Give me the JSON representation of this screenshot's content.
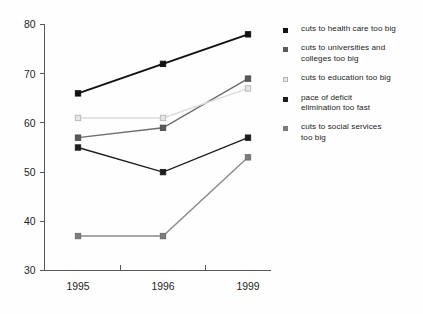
{
  "chart_data": {
    "type": "line",
    "title": "",
    "subtitle": "",
    "xlabel": "",
    "ylabel": "",
    "categories": [
      "1995",
      "1996",
      "1999"
    ],
    "x": [
      1995,
      1996,
      1999
    ],
    "ylim": [
      30,
      80
    ],
    "yticks": [
      30,
      40,
      50,
      60,
      70,
      80
    ],
    "ytick_labels": [
      "30",
      "40",
      "50",
      "60",
      "70",
      "80"
    ],
    "grid": false,
    "legend_position": "right",
    "marker": "square",
    "series": [
      {
        "name": "cuts to health care too big",
        "values": [
          66,
          72,
          78
        ],
        "color": "#111111",
        "marker_fill": "#111111",
        "marker_edge": "#111111"
      },
      {
        "name": "cuts to universities and\n colleges too big",
        "values": [
          57,
          59,
          69
        ],
        "color": "#6c6c6c",
        "marker_fill": "#5a5a5a",
        "marker_edge": "#4a4a4a"
      },
      {
        "name": "cuts to education too big",
        "values": [
          61,
          61,
          67
        ],
        "color": "#dcdcdc",
        "marker_fill": "#e6e6e6",
        "marker_edge": "#b4b4b4"
      },
      {
        "name": "pace of deficit\n elimination  too fast",
        "values": [
          55,
          50,
          57
        ],
        "color": "#1d1d1d",
        "marker_fill": "#1d1d1d",
        "marker_edge": "#1d1d1d"
      },
      {
        "name": "cuts to social services\n too big",
        "values": [
          37,
          37,
          53
        ],
        "color": "#8a8a8a",
        "marker_fill": "#7d7d7d",
        "marker_edge": "#6b6b6b"
      }
    ]
  },
  "axes": {
    "y_tick_labels": [
      "80",
      "70",
      "60",
      "50",
      "40",
      "30"
    ],
    "x_tick_labels": [
      "1995",
      "1996",
      "1999"
    ]
  },
  "legend": {
    "entries": [
      {
        "label": "cuts to health care too big",
        "swatch": "#111111",
        "hollow": false
      },
      {
        "label": "cuts to universities and\n colleges too big",
        "swatch": "#5a5a5a",
        "hollow": false
      },
      {
        "label": "cuts to education too big",
        "swatch": "#e6e6e6",
        "hollow": true
      },
      {
        "label": "pace of deficit\n elimination  too fast",
        "swatch": "#1d1d1d",
        "hollow": false
      },
      {
        "label": "cuts to social services\n too big",
        "swatch": "#7d7d7d",
        "hollow": false
      }
    ]
  }
}
